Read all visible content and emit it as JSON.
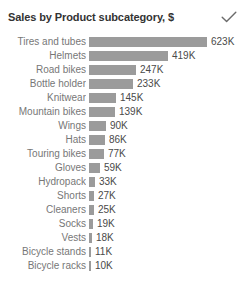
{
  "header": {
    "title": "Sales by Product subcategory, $",
    "check_icon": "checkmark-icon"
  },
  "colors": {
    "bar": "#9b9b9b",
    "title_text": "#333333",
    "category_text": "#777777",
    "value_text": "#4a4a4a",
    "background": "#ffffff"
  },
  "chart_data": {
    "type": "bar",
    "orientation": "horizontal",
    "title": "Sales by Product subcategory, $",
    "xlabel": "",
    "ylabel": "",
    "grid": false,
    "legend": false,
    "axis_visible": false,
    "data_labels": true,
    "xlim": [
      0,
      623
    ],
    "units": "K",
    "categories": [
      "Tires and tubes",
      "Helmets",
      "Road bikes",
      "Bottle holder",
      "Knitwear",
      "Mountain bikes",
      "Wings",
      "Hats",
      "Touring bikes",
      "Gloves",
      "Hydropack",
      "Shorts",
      "Cleaners",
      "Socks",
      "Vests",
      "Bicycle stands",
      "Bicycle racks"
    ],
    "values": [
      623,
      419,
      247,
      233,
      145,
      139,
      90,
      86,
      77,
      59,
      33,
      27,
      25,
      19,
      18,
      11,
      10
    ],
    "labels": [
      "623K",
      "419K",
      "247K",
      "233K",
      "145K",
      "139K",
      "90K",
      "86K",
      "77K",
      "59K",
      "33K",
      "27K",
      "25K",
      "19K",
      "18K",
      "11K",
      "10K"
    ]
  }
}
